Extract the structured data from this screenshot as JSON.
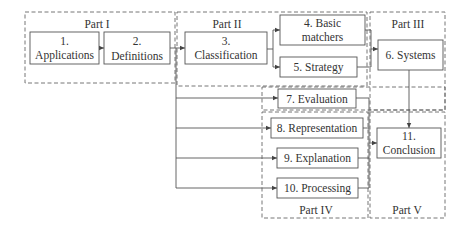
{
  "diagram": {
    "type": "flowchart",
    "colors": {
      "line": "#555555",
      "text": "#333333",
      "background": "#ffffff"
    },
    "groups": [
      {
        "id": "part1",
        "label": "Part I"
      },
      {
        "id": "part2",
        "label": "Part II"
      },
      {
        "id": "part3",
        "label": "Part III"
      },
      {
        "id": "part4",
        "label": "Part IV"
      },
      {
        "id": "part5",
        "label": "Part V"
      }
    ],
    "nodes": [
      {
        "id": "n1",
        "line1": "1.",
        "line2": "Applications"
      },
      {
        "id": "n2",
        "line1": "2.",
        "line2": "Definitions"
      },
      {
        "id": "n3",
        "line1": "3.",
        "line2": "Classification"
      },
      {
        "id": "n4",
        "line1": "4. Basic",
        "line2": "matchers"
      },
      {
        "id": "n5",
        "label": "5. Strategy"
      },
      {
        "id": "n6",
        "label": "6. Systems"
      },
      {
        "id": "n7",
        "label": "7. Evaluation"
      },
      {
        "id": "n8",
        "label": "8. Representation"
      },
      {
        "id": "n9",
        "label": "9. Explanation"
      },
      {
        "id": "n10",
        "label": "10. Processing"
      },
      {
        "id": "n11",
        "line1": "11.",
        "line2": "Conclusion"
      }
    ],
    "edges": [
      [
        "n1",
        "n2"
      ],
      [
        "n2",
        "n3"
      ],
      [
        "n3",
        "n4"
      ],
      [
        "n3",
        "n5"
      ],
      [
        "n4",
        "n6"
      ],
      [
        "n5",
        "n6"
      ],
      [
        "n2",
        "n7"
      ],
      [
        "n2",
        "n8"
      ],
      [
        "n2",
        "n9"
      ],
      [
        "n2",
        "n10"
      ],
      [
        "n6",
        "n11"
      ],
      [
        "n7",
        "n11"
      ],
      [
        "n8",
        "n11"
      ],
      [
        "n9",
        "n11"
      ],
      [
        "n10",
        "n11"
      ]
    ]
  }
}
